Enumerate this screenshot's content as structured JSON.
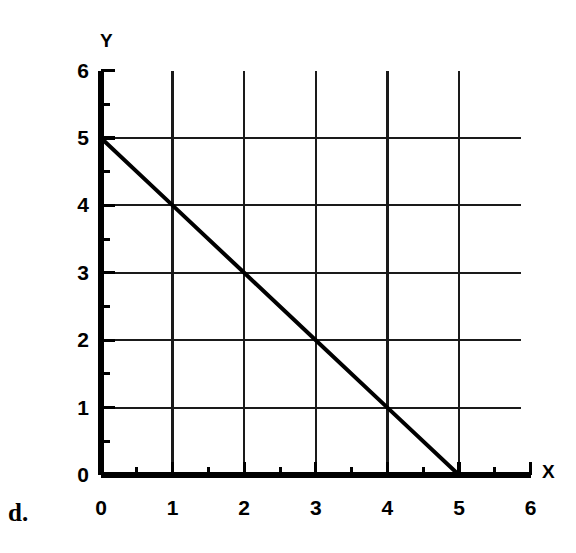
{
  "part_label": "d.",
  "ghost_text": {
    "line1": "",
    "line2": ""
  },
  "chart_data": {
    "type": "line",
    "title": "",
    "xlabel": "X",
    "ylabel": "Y",
    "xlim": [
      0,
      6
    ],
    "ylim": [
      0,
      6
    ],
    "xticks": [
      0,
      1,
      2,
      3,
      4,
      5,
      6
    ],
    "yticks": [
      0,
      1,
      2,
      3,
      4,
      5,
      6
    ],
    "xtick_labels": [
      "0",
      "1",
      "2",
      "3",
      "4",
      "5",
      "6"
    ],
    "ytick_labels": [
      "0",
      "1",
      "2",
      "3",
      "4",
      "5",
      "6"
    ],
    "minor_tick_step": 0.5,
    "grid": true,
    "grid_x_lines": [
      1,
      2,
      3,
      4,
      5
    ],
    "grid_y_lines": [
      1,
      2,
      3,
      4,
      5
    ],
    "legend": false,
    "series": [
      {
        "name": "y = 5 - x",
        "equation": "y = -x + 5",
        "slope": -1,
        "intercept": 5,
        "x": [
          0,
          1,
          2,
          3,
          4,
          5
        ],
        "values": [
          5,
          4,
          3,
          2,
          1,
          0
        ],
        "x_intercept": 5,
        "y_intercept": 5,
        "color": "#000000",
        "linewidth": 4
      }
    ],
    "annotations": []
  },
  "colors": {
    "ink": "#000000",
    "grid": "#1a1a1a",
    "paper": "#ffffff",
    "ghost": "#c9c9c9"
  }
}
